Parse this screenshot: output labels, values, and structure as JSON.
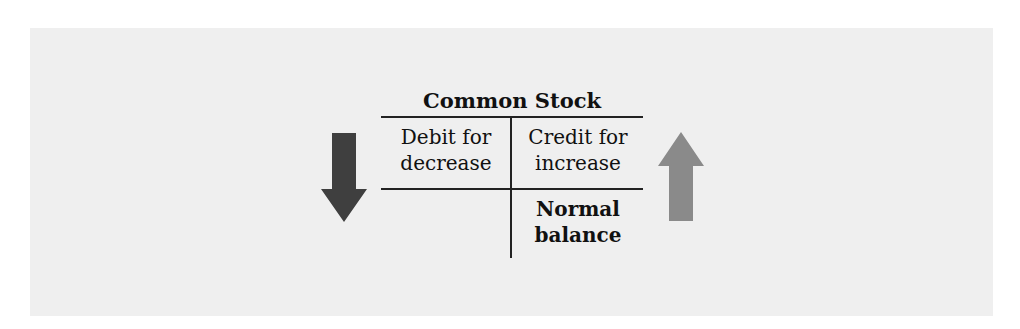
{
  "diagram": {
    "type": "t-account",
    "title": "Common Stock",
    "left_side": {
      "label_line1": "Debit for",
      "label_line2": "decrease",
      "arrow": "arrow-down-icon",
      "arrow_color": "#3f3f3f"
    },
    "right_side": {
      "label_line1": "Credit for",
      "label_line2": "increase",
      "balance_line1": "Normal",
      "balance_line2": "balance",
      "arrow": "arrow-up-icon",
      "arrow_color": "#8a8a8a"
    },
    "colors": {
      "panel_bg": "#efefef",
      "line": "#222222",
      "text": "#111111"
    }
  }
}
